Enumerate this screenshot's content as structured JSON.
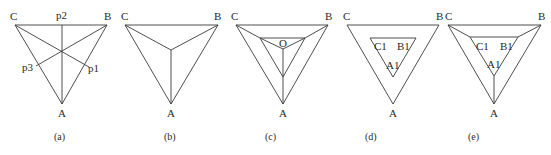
{
  "figure": {
    "panels": [
      {
        "id": "a",
        "caption": "(a)",
        "vertex_labels": {
          "C": "C",
          "B": "B",
          "A": "A"
        },
        "point_labels": {
          "p1": "p1",
          "p2": "p2",
          "p3": "p3"
        },
        "description": "Triangle CBA with three medians from each vertex meeting at centroid"
      },
      {
        "id": "b",
        "caption": "(b)",
        "vertex_labels": {
          "C": "C",
          "B": "B",
          "A": "A"
        },
        "description": "Triangle CBA with segments from each vertex to center"
      },
      {
        "id": "c",
        "caption": "(c)",
        "vertex_labels": {
          "C": "C",
          "B": "B",
          "A": "A"
        },
        "center_label": "O",
        "description": "Triangle CBA with inner triangle and segments to center O"
      },
      {
        "id": "d",
        "caption": "(d)",
        "vertex_labels": {
          "C": "C",
          "B": "B",
          "A": "A"
        },
        "inner_labels": {
          "C1": "C1",
          "B1": "B1",
          "A1": "A1"
        },
        "description": "Triangle CBA with nested inner triangle C1B1A1"
      },
      {
        "id": "e",
        "caption": "(e)",
        "vertex_labels": {
          "C": "C",
          "B": "B",
          "A": "A"
        },
        "inner_labels": {
          "C1": "C1",
          "B1": "B1",
          "A1": "A1"
        },
        "description": "Triangle CBA with inner triangle C1B1A1 joined to outer vertices"
      }
    ]
  }
}
